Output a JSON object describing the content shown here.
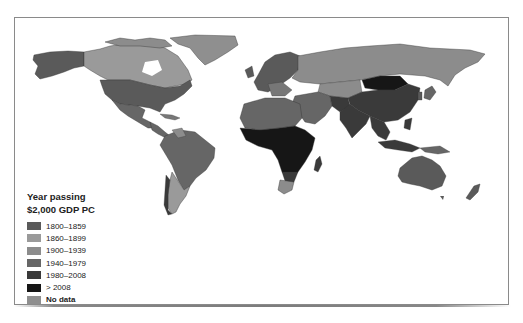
{
  "legend": {
    "title_line1": "Year passing",
    "title_line2": "$2,000 GDP PC",
    "items": [
      {
        "label": "1800–1859",
        "color": "#5a5a5a"
      },
      {
        "label": "1860–1899",
        "color": "#9a9a9a"
      },
      {
        "label": "1900–1939",
        "color": "#8c8c8c"
      },
      {
        "label": "1940–1979",
        "color": "#666666"
      },
      {
        "label": "1980–2008",
        "color": "#3a3a3a"
      },
      {
        "label": "> 2008",
        "color": "#161616"
      },
      {
        "label": "No data",
        "color": "#8f8f8f"
      }
    ]
  },
  "map": {
    "type": "choropleth",
    "regions": [
      {
        "name": "Alaska",
        "category": "1800–1859"
      },
      {
        "name": "Canada",
        "category": "1860–1899"
      },
      {
        "name": "Greenland",
        "category": "No data"
      },
      {
        "name": "United States",
        "category": "1800–1859"
      },
      {
        "name": "Mexico",
        "category": "1940–1979"
      },
      {
        "name": "Central America",
        "category": "1940–1979"
      },
      {
        "name": "Brazil",
        "category": "1940–1979"
      },
      {
        "name": "Argentina",
        "category": "1860–1899"
      },
      {
        "name": "Russia",
        "category": "1900–1939"
      },
      {
        "name": "Western Europe",
        "category": "1800–1859"
      },
      {
        "name": "North Africa",
        "category": "1940–1979"
      },
      {
        "name": "Sub-Saharan Africa",
        "category": "> 2008"
      },
      {
        "name": "South Africa",
        "category": "1900–1939"
      },
      {
        "name": "Middle East",
        "category": "1940–1979"
      },
      {
        "name": "China",
        "category": "1980–2008"
      },
      {
        "name": "Mongolia",
        "category": "> 2008"
      },
      {
        "name": "India",
        "category": "1980–2008"
      },
      {
        "name": "Southeast Asia",
        "category": "1980–2008"
      },
      {
        "name": "Japan",
        "category": "1940–1979"
      },
      {
        "name": "Australia",
        "category": "1800–1859"
      },
      {
        "name": "New Zealand",
        "category": "1800–1859"
      }
    ]
  }
}
